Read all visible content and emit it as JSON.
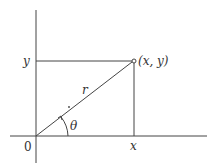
{
  "diagram": {
    "type": "polar-coordinates",
    "colors": {
      "line": "#444444",
      "text": "#333333",
      "background": "#ffffff"
    },
    "labels": {
      "y_tick": "y",
      "x_tick": "x",
      "origin": "0",
      "radius": "r",
      "angle": "θ",
      "point": "(x, y)"
    },
    "elements": [
      "x-axis",
      "y-axis",
      "radius-line r from origin to (x,y)",
      "horizontal projection to y-axis",
      "vertical projection to x-axis",
      "angle arc θ with arrow",
      "point marker (x,y)"
    ]
  }
}
